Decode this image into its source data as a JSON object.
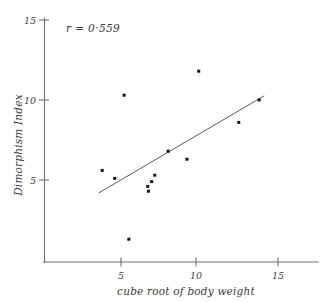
{
  "chart_data": {
    "type": "scatter",
    "title": "",
    "xlabel": "cube root of body weight",
    "ylabel": "Dimorphism Index",
    "xlim": [
      0,
      16.5
    ],
    "ylim": [
      0,
      15.6
    ],
    "xticks": [
      5,
      10,
      15
    ],
    "xtick_labels": [
      "5",
      "10",
      "15"
    ],
    "yticks": [
      5,
      10,
      15
    ],
    "ytick_labels": [
      "5",
      "10",
      "15"
    ],
    "grid": false,
    "legend": "none",
    "annotations": [
      {
        "name": "correlation-annotation",
        "text": "r = 0·559",
        "x": 4.9,
        "y": 14.5
      }
    ],
    "points": [
      {
        "x": 3.8,
        "y": 5.6
      },
      {
        "x": 4.6,
        "y": 5.1
      },
      {
        "x": 5.2,
        "y": 10.3
      },
      {
        "x": 5.5,
        "y": 1.3
      },
      {
        "x": 6.7,
        "y": 4.6
      },
      {
        "x": 6.75,
        "y": 4.3
      },
      {
        "x": 6.95,
        "y": 4.9
      },
      {
        "x": 7.15,
        "y": 5.3
      },
      {
        "x": 8.0,
        "y": 6.8
      },
      {
        "x": 9.2,
        "y": 6.3
      },
      {
        "x": 9.95,
        "y": 11.8
      },
      {
        "x": 12.5,
        "y": 8.6
      },
      {
        "x": 13.8,
        "y": 10.0
      }
    ],
    "fit_line": {
      "name": "regression-line",
      "x_start": 3.6,
      "y_start": 4.2,
      "x_end": 14.1,
      "y_end": 10.25
    },
    "colors": {
      "point": "#141414",
      "line": "#5a5a5a",
      "axis": "#6f6f6f",
      "text": "#3a3a3a",
      "background": "#ffffff"
    }
  }
}
